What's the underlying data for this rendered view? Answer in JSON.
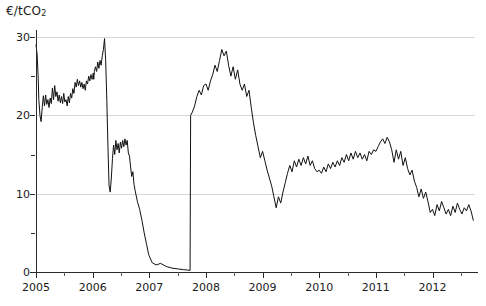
{
  "chart_data": {
    "type": "line",
    "title": "",
    "subtitle": "",
    "ylabel": "€/tCO₂",
    "ylabel_plain": "EUR per tonne CO2",
    "xlabel": "",
    "ylim": [
      0,
      30
    ],
    "xlim": [
      2005.0,
      2012.75
    ],
    "y_ticks": [
      0,
      10,
      20,
      30
    ],
    "y_ticks_minor": [
      5,
      15,
      25
    ],
    "x_ticks": [
      2005,
      2006,
      2007,
      2008,
      2009,
      2010,
      2011,
      2012
    ],
    "x_ticks_minor": [
      2005.5,
      2006.5,
      2007.5,
      2008.5,
      2009.5,
      2010.5,
      2011.5,
      2012.5
    ],
    "grid": "horizontal",
    "legend": "none",
    "line_color": "#111111",
    "grid_color": "#d7d7d7",
    "axis_color": "#2b2b2b",
    "series": [
      {
        "name": "EU ETS carbon price",
        "x": [
          2005.0,
          2005.02,
          2005.04,
          2005.05,
          2005.07,
          2005.09,
          2005.11,
          2005.13,
          2005.15,
          2005.17,
          2005.19,
          2005.21,
          2005.23,
          2005.25,
          2005.27,
          2005.29,
          2005.31,
          2005.33,
          2005.35,
          2005.37,
          2005.39,
          2005.41,
          2005.43,
          2005.45,
          2005.47,
          2005.49,
          2005.51,
          2005.53,
          2005.55,
          2005.57,
          2005.59,
          2005.61,
          2005.63,
          2005.65,
          2005.67,
          2005.69,
          2005.71,
          2005.73,
          2005.75,
          2005.77,
          2005.79,
          2005.81,
          2005.83,
          2005.85,
          2005.87,
          2005.89,
          2005.91,
          2005.93,
          2005.95,
          2005.97,
          2005.99,
          2006.0,
          2006.01,
          2006.02,
          2006.03,
          2006.05,
          2006.07,
          2006.09,
          2006.11,
          2006.13,
          2006.15,
          2006.17,
          2006.19,
          2006.21,
          2006.23,
          2006.25,
          2006.27,
          2006.29,
          2006.31,
          2006.33,
          2006.35,
          2006.37,
          2006.39,
          2006.41,
          2006.43,
          2006.45,
          2006.47,
          2006.49,
          2006.51,
          2006.53,
          2006.55,
          2006.57,
          2006.59,
          2006.61,
          2006.63,
          2006.65,
          2006.67,
          2006.69,
          2006.71,
          2006.73,
          2006.75,
          2006.79,
          2006.83,
          2006.87,
          2006.91,
          2006.95,
          2006.99,
          2007.05,
          2007.12,
          2007.2,
          2007.3,
          2007.4,
          2007.5,
          2007.6,
          2007.68,
          2007.72,
          2007.73,
          2007.76,
          2007.8,
          2007.84,
          2007.88,
          2007.92,
          2007.96,
          2008.0,
          2008.04,
          2008.08,
          2008.12,
          2008.16,
          2008.2,
          2008.24,
          2008.28,
          2008.32,
          2008.36,
          2008.4,
          2008.44,
          2008.48,
          2008.52,
          2008.56,
          2008.6,
          2008.64,
          2008.68,
          2008.72,
          2008.76,
          2008.8,
          2008.84,
          2008.88,
          2008.92,
          2008.96,
          2009.0,
          2009.04,
          2009.08,
          2009.12,
          2009.16,
          2009.2,
          2009.24,
          2009.28,
          2009.32,
          2009.36,
          2009.4,
          2009.44,
          2009.48,
          2009.52,
          2009.56,
          2009.6,
          2009.64,
          2009.68,
          2009.72,
          2009.76,
          2009.8,
          2009.84,
          2009.88,
          2009.92,
          2009.96,
          2010.0,
          2010.04,
          2010.08,
          2010.12,
          2010.16,
          2010.2,
          2010.24,
          2010.28,
          2010.32,
          2010.36,
          2010.4,
          2010.44,
          2010.48,
          2010.52,
          2010.56,
          2010.6,
          2010.64,
          2010.68,
          2010.72,
          2010.76,
          2010.8,
          2010.84,
          2010.88,
          2010.92,
          2010.96,
          2011.0,
          2011.04,
          2011.08,
          2011.12,
          2011.16,
          2011.2,
          2011.24,
          2011.28,
          2011.32,
          2011.36,
          2011.4,
          2011.44,
          2011.48,
          2011.52,
          2011.56,
          2011.6,
          2011.64,
          2011.68,
          2011.72,
          2011.76,
          2011.8,
          2011.84,
          2011.88,
          2011.92,
          2011.96,
          2012.0,
          2012.04,
          2012.08,
          2012.12,
          2012.16,
          2012.2,
          2012.24,
          2012.28,
          2012.32,
          2012.36,
          2012.4,
          2012.44,
          2012.48,
          2012.52,
          2012.56,
          2012.6,
          2012.64,
          2012.68,
          2012.72
        ],
        "y": [
          29.0,
          27.8,
          24.5,
          22.0,
          20.0,
          19.2,
          21.0,
          22.5,
          21.2,
          22.6,
          21.4,
          22.0,
          21.0,
          22.2,
          21.5,
          23.5,
          22.0,
          23.8,
          22.4,
          23.0,
          21.8,
          22.6,
          21.6,
          22.4,
          21.5,
          22.8,
          21.7,
          22.0,
          21.2,
          22.4,
          21.6,
          22.8,
          22.2,
          23.4,
          22.8,
          24.2,
          23.6,
          24.6,
          23.8,
          24.4,
          23.6,
          24.2,
          23.4,
          24.0,
          23.2,
          24.4,
          24.0,
          25.0,
          24.4,
          25.2,
          24.6,
          24.8,
          25.4,
          24.6,
          25.6,
          26.2,
          25.6,
          26.8,
          26.0,
          27.0,
          26.4,
          27.6,
          28.4,
          29.8,
          27.0,
          22.0,
          16.0,
          11.0,
          10.2,
          12.0,
          14.5,
          16.2,
          15.0,
          16.8,
          15.6,
          16.4,
          15.2,
          16.6,
          15.8,
          16.8,
          16.0,
          17.0,
          16.2,
          16.8,
          15.2,
          14.8,
          13.4,
          12.2,
          12.8,
          11.2,
          10.4,
          9.0,
          8.0,
          6.6,
          5.0,
          3.6,
          2.2,
          1.2,
          0.9,
          1.1,
          0.7,
          0.5,
          0.4,
          0.3,
          0.25,
          0.2,
          20.0,
          20.4,
          21.2,
          22.4,
          23.2,
          22.6,
          23.8,
          24.0,
          23.2,
          24.4,
          25.2,
          26.4,
          25.6,
          27.0,
          28.4,
          27.6,
          28.2,
          26.4,
          25.0,
          26.2,
          24.6,
          25.8,
          24.0,
          23.2,
          24.0,
          22.4,
          23.2,
          21.0,
          19.0,
          17.4,
          16.0,
          14.6,
          15.4,
          14.2,
          13.0,
          12.0,
          11.0,
          9.6,
          8.2,
          9.6,
          8.8,
          10.2,
          11.4,
          12.6,
          13.6,
          12.8,
          14.2,
          13.4,
          14.4,
          13.6,
          14.6,
          13.8,
          14.8,
          13.6,
          14.2,
          13.2,
          12.8,
          13.0,
          12.6,
          13.4,
          12.8,
          13.8,
          13.2,
          14.0,
          13.4,
          14.2,
          13.6,
          14.6,
          14.0,
          15.0,
          14.2,
          15.2,
          14.4,
          15.4,
          14.6,
          15.2,
          14.4,
          15.0,
          14.2,
          15.4,
          15.0,
          15.6,
          15.4,
          16.0,
          16.6,
          17.0,
          16.4,
          17.2,
          16.6,
          15.6,
          14.0,
          15.6,
          14.4,
          15.4,
          13.6,
          14.6,
          13.2,
          12.4,
          13.0,
          11.6,
          10.8,
          9.6,
          10.6,
          9.4,
          10.2,
          9.0,
          7.6,
          8.0,
          7.2,
          8.6,
          7.8,
          9.0,
          8.2,
          7.4,
          8.0,
          7.2,
          8.4,
          7.6,
          8.8,
          8.0,
          7.4,
          8.2,
          7.8,
          8.6,
          7.8,
          6.6
        ]
      }
    ],
    "annotations": [
      {
        "label": "Phase I price collapse",
        "x": 2006.21,
        "y": 29.8
      },
      {
        "label": "Phase II contract start (step)",
        "x": 2007.72,
        "y": 20.0
      }
    ]
  },
  "axis": {
    "y_tick_labels": [
      "0",
      "10",
      "20",
      "30"
    ],
    "x_tick_labels": [
      "2005",
      "2006",
      "2007",
      "2008",
      "2009",
      "2010",
      "2011",
      "2012"
    ],
    "ylabel": "€/tCO₂"
  }
}
